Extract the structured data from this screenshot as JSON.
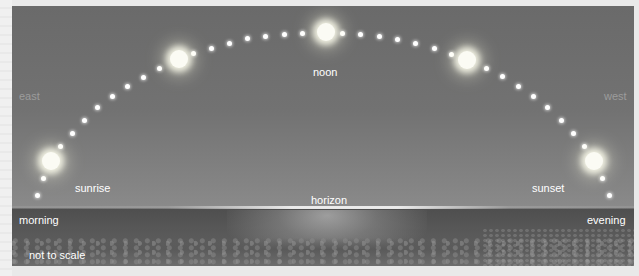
{
  "figure": {
    "labels": {
      "east": "east",
      "west": "west",
      "noon": "noon",
      "sunrise": "sunrise",
      "sunset": "sunset",
      "horizon": "horizon",
      "morning": "morning",
      "evening": "evening",
      "scale_note": "not to scale"
    },
    "suns": [
      {
        "name": "sunrise-sun",
        "x": 51,
        "y": 161
      },
      {
        "name": "morning-sun",
        "x": 179,
        "y": 59
      },
      {
        "name": "noon-sun",
        "x": 326,
        "y": 32
      },
      {
        "name": "afternoon-sun",
        "x": 467,
        "y": 60
      },
      {
        "name": "sunset-sun",
        "x": 594,
        "y": 161
      }
    ],
    "path_dots": [
      [
        37,
        195
      ],
      [
        43,
        178
      ],
      [
        60,
        146
      ],
      [
        72,
        133
      ],
      [
        84,
        120
      ],
      [
        97,
        107
      ],
      [
        112,
        96
      ],
      [
        127,
        86
      ],
      [
        143,
        77
      ],
      [
        159,
        68
      ],
      [
        193,
        53
      ],
      [
        211,
        48
      ],
      [
        229,
        43
      ],
      [
        247,
        38
      ],
      [
        265,
        36
      ],
      [
        284,
        34
      ],
      [
        302,
        33
      ],
      [
        342,
        33
      ],
      [
        360,
        34
      ],
      [
        379,
        36
      ],
      [
        397,
        39
      ],
      [
        415,
        43
      ],
      [
        434,
        48
      ],
      [
        451,
        54
      ],
      [
        486,
        68
      ],
      [
        502,
        76
      ],
      [
        518,
        86
      ],
      [
        533,
        96
      ],
      [
        547,
        107
      ],
      [
        561,
        120
      ],
      [
        573,
        133
      ],
      [
        584,
        146
      ],
      [
        602,
        178
      ],
      [
        609,
        195
      ]
    ],
    "colors": {
      "sky": "#727272",
      "sea": "#565656",
      "label": "#ffffff",
      "direction_label": "#9c9c9c"
    }
  }
}
